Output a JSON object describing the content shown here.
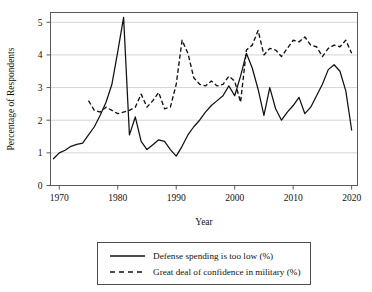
{
  "chart_data": {
    "type": "line",
    "title": "",
    "xlabel": "Year",
    "ylabel": "Percentage of Respondents",
    "xlim": [
      1968.5,
      2021.0
    ],
    "ylim": [
      0,
      5.3
    ],
    "grid": true,
    "grid_axis": "y",
    "legend_position": "below",
    "xticks": [
      1970,
      1980,
      1990,
      2000,
      2010,
      2020
    ],
    "xtick_labels": [
      "1970",
      "1980",
      "1990",
      "2000",
      "2010",
      "2020"
    ],
    "yticks": [
      0,
      1,
      2,
      3,
      4,
      5
    ],
    "ytick_labels": [
      "0",
      "1",
      "2",
      "3",
      "4",
      "5"
    ],
    "series": [
      {
        "name": "Defense spending is too low (%)",
        "style": "solid",
        "color": "#111111",
        "x": [
          1969,
          1970,
          1971,
          1972,
          1973,
          1974,
          1975,
          1976,
          1977,
          1978,
          1979,
          1980,
          1981,
          1982,
          1983,
          1984,
          1985,
          1986,
          1987,
          1988,
          1989,
          1990,
          1991,
          1992,
          1993,
          1994,
          1995,
          1996,
          1997,
          1998,
          1999,
          2000,
          2001,
          2002,
          2003,
          2004,
          2005,
          2006,
          2007,
          2008,
          2009,
          2010,
          2011,
          2012,
          2013,
          2014,
          2015,
          2016,
          2017,
          2018,
          2019,
          2020
        ],
        "values": [
          0.82,
          1.0,
          1.08,
          1.2,
          1.26,
          1.3,
          1.55,
          1.8,
          2.15,
          2.55,
          3.1,
          4.1,
          5.15,
          1.55,
          2.1,
          1.35,
          1.1,
          1.25,
          1.4,
          1.35,
          1.1,
          0.9,
          1.2,
          1.55,
          1.8,
          2.0,
          2.25,
          2.45,
          2.6,
          2.75,
          3.05,
          2.75,
          3.35,
          4.05,
          3.6,
          2.95,
          2.15,
          3.0,
          2.35,
          2.0,
          2.25,
          2.45,
          2.7,
          2.2,
          2.4,
          2.75,
          3.1,
          3.55,
          3.7,
          3.5,
          2.9,
          1.7
        ]
      },
      {
        "name": "Great deal of confidence in military (%)",
        "style": "dashed",
        "color": "#111111",
        "x": [
          1975,
          1976,
          1977,
          1978,
          1980,
          1982,
          1983,
          1984,
          1985,
          1986,
          1987,
          1988,
          1989,
          1990,
          1991,
          1992,
          1993,
          1994,
          1995,
          1996,
          1997,
          1998,
          1999,
          2000,
          2001,
          2002,
          2003,
          2004,
          2005,
          2006,
          2007,
          2008,
          2009,
          2010,
          2011,
          2012,
          2013,
          2014,
          2015,
          2016,
          2017,
          2018,
          2019,
          2020
        ],
        "values": [
          2.6,
          2.3,
          2.25,
          2.4,
          2.2,
          2.3,
          2.4,
          2.8,
          2.4,
          2.6,
          2.85,
          2.35,
          2.4,
          3.1,
          4.45,
          4.05,
          3.3,
          3.1,
          3.05,
          3.2,
          3.05,
          3.1,
          3.35,
          3.2,
          2.55,
          4.15,
          4.3,
          4.75,
          4.0,
          4.2,
          4.15,
          3.95,
          4.2,
          4.45,
          4.4,
          4.55,
          4.3,
          4.25,
          3.95,
          4.2,
          4.3,
          4.25,
          4.45,
          4.05
        ]
      }
    ],
    "legend_entries": [
      {
        "label": "Defense spending is too low (%)",
        "style": "solid"
      },
      {
        "label": "Great deal of confidence in military (%)",
        "style": "dashed"
      }
    ]
  }
}
